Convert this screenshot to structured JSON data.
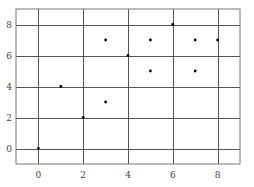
{
  "chart_data": {
    "type": "scatter",
    "title": "",
    "xlabel": "",
    "ylabel": "",
    "xlim": [
      -1,
      9
    ],
    "ylim": [
      -1,
      9
    ],
    "grid": true,
    "legend": null,
    "x_ticks": [
      0,
      2,
      4,
      6,
      8
    ],
    "y_ticks": [
      0,
      2,
      4,
      6,
      8
    ],
    "x_tick_labels": [
      "0",
      "2",
      "4",
      "6",
      "8"
    ],
    "y_tick_labels": [
      "0",
      "2",
      "4",
      "6",
      "8"
    ],
    "series": [
      {
        "name": "points",
        "color": "#000000",
        "points": [
          {
            "x": 0,
            "y": 0
          },
          {
            "x": 1,
            "y": 4
          },
          {
            "x": 2,
            "y": 2
          },
          {
            "x": 3,
            "y": 3
          },
          {
            "x": 3,
            "y": 7
          },
          {
            "x": 4,
            "y": 6
          },
          {
            "x": 5,
            "y": 5
          },
          {
            "x": 5,
            "y": 7
          },
          {
            "x": 6,
            "y": 8
          },
          {
            "x": 7,
            "y": 5
          },
          {
            "x": 7,
            "y": 7
          },
          {
            "x": 8,
            "y": 7
          }
        ]
      }
    ]
  },
  "colors": {
    "grid": "#555555",
    "frame": "#777777",
    "point": "#000000",
    "label": "#444444"
  }
}
